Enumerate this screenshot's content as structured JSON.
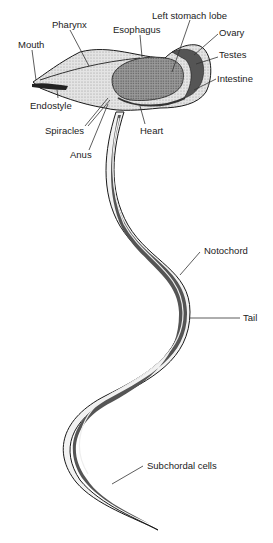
{
  "figure": {
    "labels": [
      {
        "id": "mouth",
        "text": "Mouth"
      },
      {
        "id": "pharynx",
        "text": "Pharynx"
      },
      {
        "id": "esophagus",
        "text": "Esophagus"
      },
      {
        "id": "left-stomach-lobe",
        "text": "Left stomach lobe"
      },
      {
        "id": "ovary",
        "text": "Ovary"
      },
      {
        "id": "testes",
        "text": "Testes"
      },
      {
        "id": "intestine",
        "text": "Intestine"
      },
      {
        "id": "endostyle",
        "text": "Endostyle"
      },
      {
        "id": "spiracles",
        "text": "Spiracles"
      },
      {
        "id": "heart",
        "text": "Heart"
      },
      {
        "id": "anus",
        "text": "Anus"
      },
      {
        "id": "notochord",
        "text": "Notochord"
      },
      {
        "id": "tail",
        "text": "Tail"
      },
      {
        "id": "subchordal-cells",
        "text": "Subchordal cells"
      }
    ],
    "colors": {
      "outline": "#1a1a1a",
      "trunk_fill": "#d9d9d9",
      "organ_fill": "#8c8c8c",
      "dark_fill": "#4a4a4a",
      "leader_line": "#333333"
    }
  }
}
